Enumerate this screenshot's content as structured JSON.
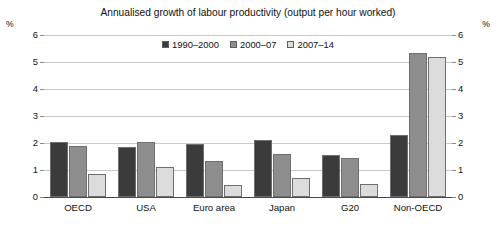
{
  "chart_data": {
    "type": "bar",
    "title": "Annualised growth of labour productivity (output per hour worked)",
    "xlabel": "",
    "ylabel": "%",
    "y_unit_left": "%",
    "y_unit_right": "%",
    "ylim": [
      0,
      6
    ],
    "yticks": [
      0,
      1,
      2,
      3,
      4,
      5,
      6
    ],
    "ytick_labels": [
      "0",
      "1",
      "2",
      "3",
      "4",
      "5",
      "6"
    ],
    "grid": true,
    "legend_position": "top-center",
    "categories": [
      "OECD",
      "USA",
      "Euro area",
      "Japan",
      "G20",
      "Non-OECD"
    ],
    "series": [
      {
        "name": "1990–2000",
        "color": "#3b3b3b",
        "values": [
          2.05,
          1.85,
          1.95,
          2.1,
          1.55,
          2.3
        ]
      },
      {
        "name": "2000–07",
        "color": "#8e8e8e",
        "values": [
          1.9,
          2.05,
          1.35,
          1.6,
          1.45,
          5.35
        ]
      },
      {
        "name": "2007–14",
        "color": "#dcdcdc",
        "values": [
          0.85,
          1.1,
          0.45,
          0.7,
          0.5,
          5.2
        ]
      }
    ]
  },
  "colors": {
    "series_dark": "#3b3b3b",
    "series_medium": "#8e8e8e",
    "series_light": "#dcdcdc",
    "gridline": "#c9c9c9",
    "axis": "#4a4a4a",
    "text": "#111111",
    "background": "#ffffff"
  }
}
